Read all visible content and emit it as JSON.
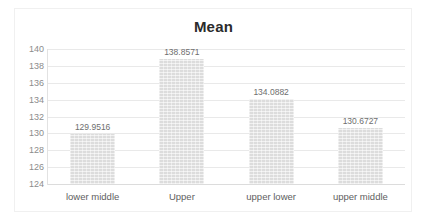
{
  "chart_data": {
    "type": "bar",
    "title": "Mean",
    "xlabel": "",
    "ylabel": "",
    "categories": [
      "lower middle",
      "Upper",
      "upper lower",
      "upper middle"
    ],
    "values": [
      129.9516,
      138.8571,
      134.0882,
      130.6727
    ],
    "value_labels": [
      "129.9516",
      "138.8571",
      "134.0882",
      "130.6727"
    ],
    "ylim": [
      124,
      140
    ],
    "ytick_step": 2,
    "yticks": [
      140,
      138,
      136,
      134,
      132,
      130,
      128,
      126,
      124
    ],
    "ytick_labels": [
      "140",
      "138",
      "136",
      "134",
      "132",
      "130",
      "128",
      "126",
      "124"
    ],
    "grid": "horizontal",
    "legend": "none",
    "series": [
      {
        "name": "Mean",
        "values": [
          129.9516,
          138.8571,
          134.0882,
          130.6727
        ]
      }
    ],
    "colors": {
      "bar_fill": "#e4e4e4",
      "gridline": "#e9e9e9",
      "axis_line": "#dcdcdc",
      "title_text": "#2b2b2b",
      "tick_text": "#8c8c8c",
      "category_text": "#5e5e5e",
      "data_label_text": "#6e6e6e",
      "background": "#ffffff",
      "frame_border": "#f0f0f0"
    }
  }
}
